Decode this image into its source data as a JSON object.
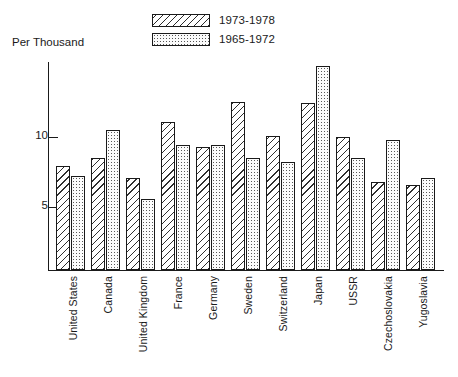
{
  "chart_data": {
    "type": "bar",
    "title": "",
    "ylabel": "Per Thousand",
    "xlabel": "",
    "ylim": [
      0.5,
      15.8
    ],
    "yticks": [
      5,
      10
    ],
    "grid": false,
    "legend_position": "top-center",
    "categories": [
      "United States",
      "Canada",
      "United Kingdom",
      "France",
      "Germany",
      "Sweden",
      "Switzerland",
      "Japan",
      "USSR",
      "Czechoslovakia",
      "Yugoslavia"
    ],
    "series": [
      {
        "name": "1973-1978",
        "fill": "diagonal-hatch",
        "values": [
          7.9,
          8.5,
          7.1,
          11.1,
          9.3,
          12.5,
          10.1,
          12.4,
          10.0,
          6.8,
          6.6
        ]
      },
      {
        "name": "1965-1972",
        "fill": "stipple-dots",
        "values": [
          7.2,
          10.5,
          5.6,
          9.4,
          9.4,
          8.5,
          8.2,
          15.1,
          8.5,
          9.8,
          7.1
        ]
      }
    ]
  },
  "axis": {
    "y_title": "Per Thousand",
    "tick_labels": [
      "10",
      "5"
    ]
  },
  "legend": {
    "items": [
      {
        "label": "1973-1978",
        "pattern": "diagonal-hatch"
      },
      {
        "label": "1965-1972",
        "pattern": "stipple-dots"
      }
    ]
  },
  "colors": {
    "ink": "#1a1a1a",
    "hatch": "#2f2f2f",
    "stipple": "#5a5a5a",
    "background": "#ffffff"
  }
}
